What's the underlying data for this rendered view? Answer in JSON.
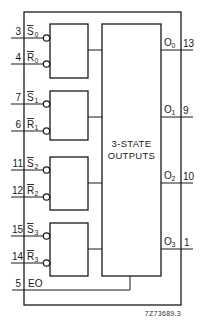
{
  "diagram": {
    "title_block": {
      "line1": "3-STATE",
      "line2": "OUTPUTS"
    },
    "figure_code": "7Z73689.3",
    "latches": [
      {
        "set": {
          "pin": "3",
          "name": "S",
          "sub": "0"
        },
        "reset": {
          "pin": "4",
          "name": "R",
          "sub": "0"
        }
      },
      {
        "set": {
          "pin": "7",
          "name": "S",
          "sub": "1"
        },
        "reset": {
          "pin": "6",
          "name": "R",
          "sub": "1"
        }
      },
      {
        "set": {
          "pin": "11",
          "name": "S",
          "sub": "2"
        },
        "reset": {
          "pin": "12",
          "name": "R",
          "sub": "2"
        }
      },
      {
        "set": {
          "pin": "15",
          "name": "S",
          "sub": "3"
        },
        "reset": {
          "pin": "14",
          "name": "R",
          "sub": "3"
        }
      }
    ],
    "enable": {
      "pin": "5",
      "name": "EO"
    },
    "outputs": [
      {
        "name": "O",
        "sub": "0",
        "pin": "13"
      },
      {
        "name": "O",
        "sub": "1",
        "pin": "9"
      },
      {
        "name": "O",
        "sub": "2",
        "pin": "10"
      },
      {
        "name": "O",
        "sub": "3",
        "pin": "1"
      }
    ],
    "colors": {
      "line": "#1a1a1a",
      "background": "#ffffff"
    }
  }
}
